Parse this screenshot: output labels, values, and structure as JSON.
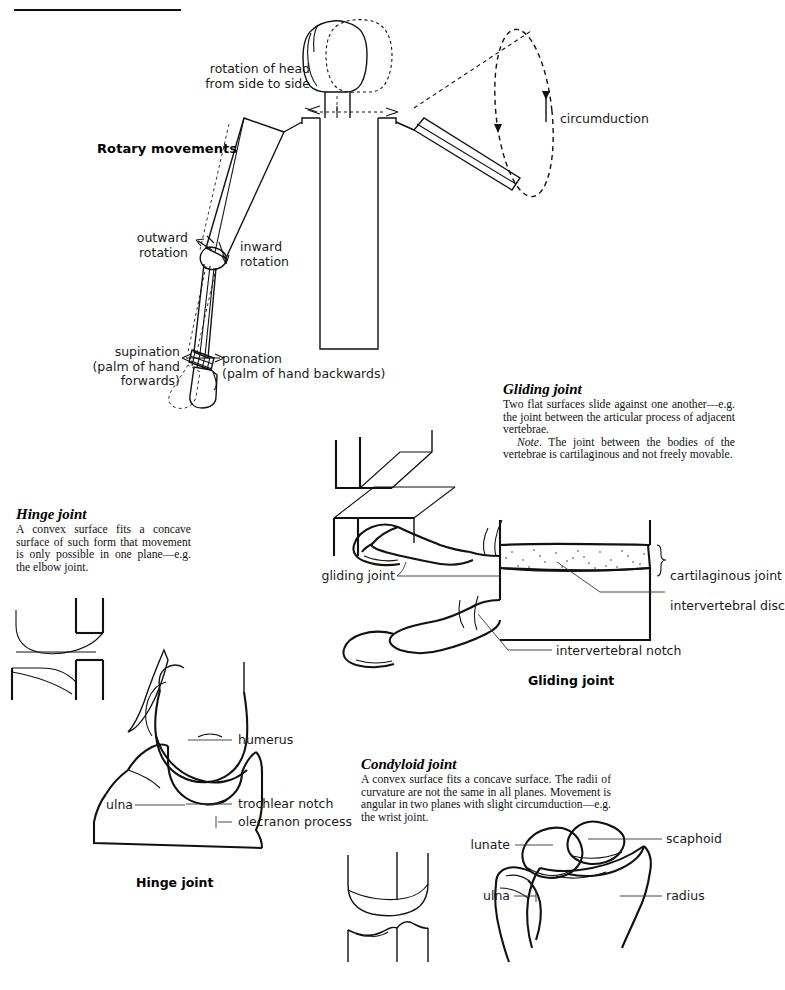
{
  "page": {
    "ink_color": "#111111",
    "background": "#ffffff"
  },
  "rotary": {
    "section_title": "Rotary movements",
    "labels": {
      "head_rotation_line1": "rotation of head",
      "head_rotation_line2": "from side to side",
      "circumduction": "circumduction",
      "outward_line1": "outward",
      "outward_line2": "rotation",
      "inward_line1": "inward",
      "inward_line2": "rotation",
      "supination_line1": "supination",
      "supination_line2": "(palm of hand",
      "supination_line3": "forwards)",
      "pronation_line1": "pronation",
      "pronation_line2": "(palm of hand backwards)"
    }
  },
  "gliding": {
    "heading": "Gliding joint",
    "body1": "Two flat surfaces slide against one another—e.g. the joint between the articular process of adjacent vertebrae.",
    "note_italic": "Note",
    "body2": ". The joint between the bodies of the vertebrae is cartilaginous and not freely movable.",
    "caption": "Gliding joint",
    "labels": {
      "gliding_joint": "gliding joint",
      "cartilaginous_joint": "cartilaginous joint",
      "intervertebral_disc": "intervertebral disc",
      "intervertebral_notch": "intervertebral notch"
    }
  },
  "hinge": {
    "heading": "Hinge joint",
    "body": "A convex surface fits a concave surface of such form that movement is only possible in one plane—e.g. the elbow joint.",
    "caption": "Hinge joint",
    "labels": {
      "humerus": "humerus",
      "trochlear_notch": "trochlear notch",
      "olecranon_process": "olecranon process",
      "ulna": "ulna"
    }
  },
  "condyloid": {
    "heading": "Condyloid joint",
    "body": "A convex surface fits a concave surface. The radii of curvature are not the same in all planes. Movement is angular in two planes with slight circumduction—e.g. the wrist joint.",
    "labels": {
      "scaphoid": "scaphoid",
      "lunate": "lunate",
      "ulna": "ulna",
      "radius": "radius"
    }
  }
}
